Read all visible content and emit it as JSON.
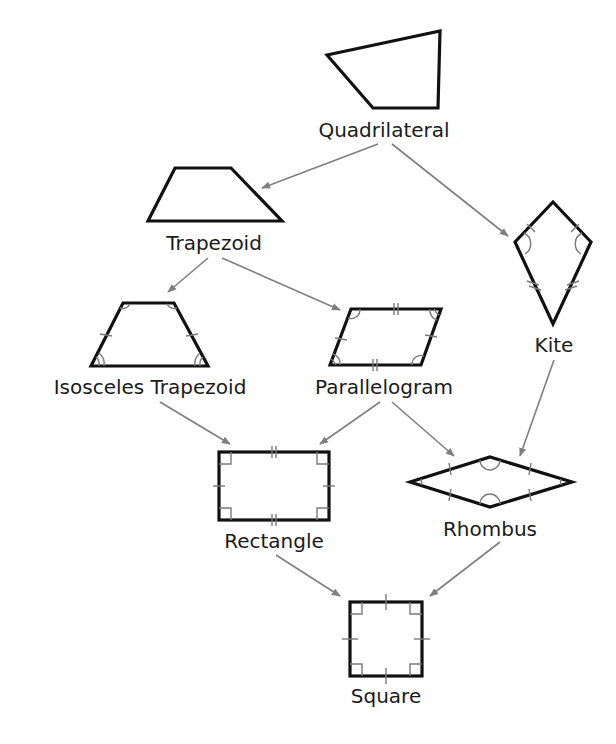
{
  "diagram": {
    "nodes": [
      {
        "id": "quadrilateral",
        "label": "Quadrilateral"
      },
      {
        "id": "trapezoid",
        "label": "Trapezoid"
      },
      {
        "id": "kite",
        "label": "Kite"
      },
      {
        "id": "isosceles_trapezoid",
        "label": "Isosceles Trapezoid"
      },
      {
        "id": "parallelogram",
        "label": "Parallelogram"
      },
      {
        "id": "rectangle",
        "label": "Rectangle"
      },
      {
        "id": "rhombus",
        "label": "Rhombus"
      },
      {
        "id": "square",
        "label": "Square"
      }
    ],
    "edges": [
      {
        "from": "quadrilateral",
        "to": "trapezoid"
      },
      {
        "from": "quadrilateral",
        "to": "kite"
      },
      {
        "from": "trapezoid",
        "to": "isosceles_trapezoid"
      },
      {
        "from": "trapezoid",
        "to": "parallelogram"
      },
      {
        "from": "isosceles_trapezoid",
        "to": "rectangle"
      },
      {
        "from": "parallelogram",
        "to": "rectangle"
      },
      {
        "from": "parallelogram",
        "to": "rhombus"
      },
      {
        "from": "kite",
        "to": "rhombus"
      },
      {
        "from": "rectangle",
        "to": "square"
      },
      {
        "from": "rhombus",
        "to": "square"
      }
    ]
  },
  "colors": {
    "shape_stroke": "#111111",
    "arrow": "#7f7f7f",
    "marks": "#7a7a7a",
    "background": "#ffffff"
  }
}
